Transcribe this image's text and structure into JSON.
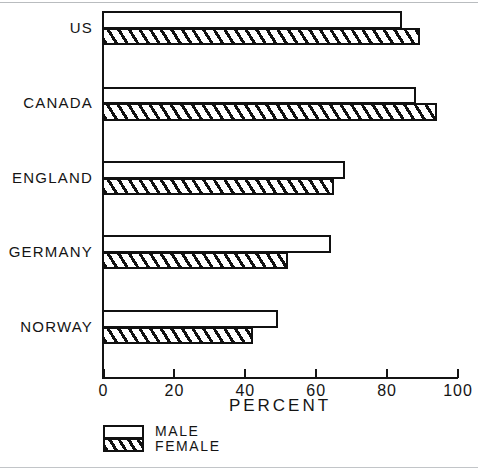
{
  "chart_data": {
    "type": "bar",
    "orientation": "horizontal",
    "title": "",
    "xlabel": "PERCENT",
    "ylabel": "",
    "xlim": [
      0,
      100
    ],
    "grid": false,
    "legend_position": "bottom-left",
    "categories": [
      "US",
      "CANADA",
      "ENGLAND",
      "GERMANY",
      "NORWAY"
    ],
    "series": [
      {
        "name": "MALE",
        "values": [
          84,
          88,
          68,
          64,
          49
        ]
      },
      {
        "name": "FEMALE",
        "values": [
          89,
          94,
          65,
          52,
          42
        ]
      }
    ],
    "xticks": [
      0,
      20,
      40,
      60,
      80,
      100
    ],
    "xtick_labels": [
      "0",
      "20",
      "40",
      "60",
      "80",
      "100"
    ]
  },
  "axis": {
    "x_title": "PERCENT",
    "ticks": [
      {
        "label": "0",
        "value": 0
      },
      {
        "label": "20",
        "value": 20
      },
      {
        "label": "40",
        "value": 40
      },
      {
        "label": "60",
        "value": 60
      },
      {
        "label": "80",
        "value": 80
      },
      {
        "label": "100",
        "value": 100
      }
    ]
  },
  "categories": [
    {
      "label": "US",
      "male": 84,
      "female": 89
    },
    {
      "label": "CANADA",
      "male": 88,
      "female": 94
    },
    {
      "label": "ENGLAND",
      "male": 68,
      "female": 65
    },
    {
      "label": "GERMANY",
      "male": 64,
      "female": 52
    },
    {
      "label": "NORWAY",
      "male": 49,
      "female": 42
    }
  ],
  "legend": {
    "male_label": "MALE",
    "female_label": "FEMALE"
  },
  "colors": {
    "ink": "#111111",
    "paper": "#ffffff",
    "scan_line": "#b9bcbf"
  }
}
